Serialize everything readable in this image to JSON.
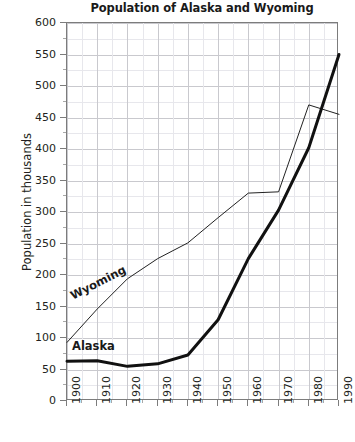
{
  "chart_data": {
    "type": "line",
    "title": "Population of Alaska and Wyoming",
    "xlabel": "",
    "ylabel": "Population in thousands",
    "x": [
      1900,
      1910,
      1920,
      1930,
      1940,
      1950,
      1960,
      1970,
      1980,
      1990
    ],
    "xtick_labels": [
      "1900",
      "1910",
      "1920",
      "1930",
      "1940",
      "1950",
      "1960",
      "1970",
      "1980",
      "1990"
    ],
    "ytick_labels": [
      "0",
      "50",
      "100",
      "150",
      "200",
      "250",
      "300",
      "350",
      "400",
      "450",
      "500",
      "550",
      "600"
    ],
    "ytick_values": [
      0,
      50,
      100,
      150,
      200,
      250,
      300,
      350,
      400,
      450,
      500,
      550,
      600
    ],
    "xlim": [
      1900,
      1990
    ],
    "ylim": [
      0,
      600
    ],
    "grid": true,
    "minor_grid": true,
    "legend": "inline-labels",
    "series": [
      {
        "name": "Wyoming",
        "style": "thin",
        "color": "#222222",
        "width": 1,
        "values": [
          93,
          146,
          194,
          226,
          251,
          291,
          330,
          332,
          470,
          455
        ]
      },
      {
        "name": "Alaska",
        "style": "thick",
        "color": "#111111",
        "width": 3,
        "values": [
          63,
          64,
          55,
          59,
          73,
          129,
          226,
          303,
          402,
          550
        ]
      }
    ],
    "annotations": [
      {
        "text": "Wyoming",
        "x": 1903,
        "y": 168
      },
      {
        "text": "Alaska",
        "x": 1903,
        "y": 98
      }
    ]
  },
  "caption": {
    "cropped_text": ""
  }
}
